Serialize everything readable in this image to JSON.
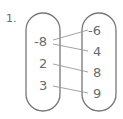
{
  "problem": {
    "number": "1.",
    "domain": [
      "-8",
      "2",
      "3"
    ],
    "range": [
      "-6",
      "4",
      "8",
      "9"
    ],
    "mappings": [
      {
        "from": "-8",
        "to": "-6"
      },
      {
        "from": "-8",
        "to": "4"
      },
      {
        "from": "2",
        "to": "8"
      },
      {
        "from": "3",
        "to": "9"
      }
    ],
    "colors": {
      "stroke": "#777777",
      "line": "#999999",
      "text": "#6a6a6a"
    }
  }
}
